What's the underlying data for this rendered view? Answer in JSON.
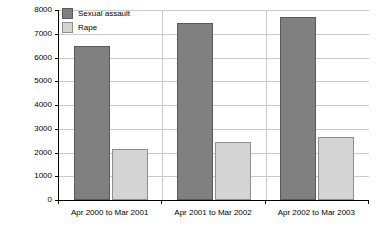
{
  "chart_data": {
    "type": "bar",
    "title": "",
    "subtitle": "",
    "xlabel": "",
    "ylabel": "",
    "categories": [
      "Apr 2000 to Mar 2001",
      "Apr 2001 to Mar 2002",
      "Apr 2002 to Mar 2003"
    ],
    "series": [
      {
        "name": "Sexual assault",
        "color": "#808080",
        "values": [
          6500,
          7450,
          7700
        ]
      },
      {
        "name": "Rape",
        "color": "#d4d4d4",
        "values": [
          2150,
          2450,
          2650
        ]
      }
    ],
    "ylim": [
      0,
      8000
    ],
    "yticks": [
      0,
      1000,
      2000,
      3000,
      4000,
      5000,
      6000,
      7000,
      8000
    ],
    "ytick_labels": [
      "0",
      "1000",
      "2000",
      "3000",
      "4000",
      "5000",
      "6000",
      "7000",
      "8000"
    ],
    "grid": "horizontal",
    "legend_position": "top-left",
    "axis_color": "#000000",
    "grid_color": "#c9c9c9",
    "background": "#ffffff"
  }
}
